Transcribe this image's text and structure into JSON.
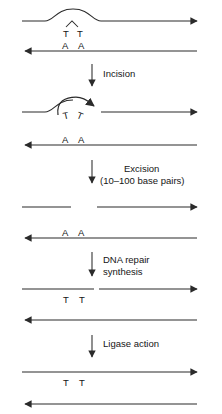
{
  "figure": {
    "type": "process-diagram",
    "stage_count": 5,
    "step_count": 4
  },
  "steps": [
    {
      "id": "incision",
      "label": "Incision",
      "label_lines": [
        "Incision"
      ]
    },
    {
      "id": "excision",
      "label": "Excision (10–100 base pairs)",
      "label_lines": [
        "Excision",
        "(10–100 base pairs)"
      ]
    },
    {
      "id": "dna-repair-synthesis",
      "label": "DNA repair synthesis",
      "label_lines": [
        "DNA repair",
        "synthesis"
      ]
    },
    {
      "id": "ligase-action",
      "label": "Ligase action",
      "label_lines": [
        "Ligase action"
      ]
    }
  ],
  "stages": [
    {
      "id": "stage-damaged",
      "top_strand": {
        "direction": "rightward",
        "continuous": true,
        "bulge": true
      },
      "top_bases": [
        "T",
        "T"
      ],
      "dimer_bond": "^",
      "bottom_strand": {
        "direction": "leftward",
        "continuous": true
      },
      "bottom_bases": [
        "A",
        "A"
      ]
    },
    {
      "id": "stage-incised",
      "top_strand": {
        "direction": "rightward",
        "continuous": false,
        "bulge": true,
        "flap": true
      },
      "top_bases": [
        "T",
        "T"
      ],
      "bottom_strand": {
        "direction": "leftward",
        "continuous": true
      },
      "bottom_bases": [
        "A",
        "A"
      ]
    },
    {
      "id": "stage-excised",
      "top_strand": {
        "direction": "rightward",
        "continuous": false,
        "gap": true
      },
      "top_bases": [],
      "bottom_strand": {
        "direction": "leftward",
        "continuous": true
      },
      "bottom_bases": [
        "A",
        "A"
      ]
    },
    {
      "id": "stage-resynthesized",
      "top_strand": {
        "direction": "rightward",
        "continuous": false,
        "nick": true
      },
      "top_bases": [
        "T",
        "T"
      ],
      "bottom_strand": {
        "direction": "leftward",
        "continuous": true
      },
      "bottom_bases": []
    },
    {
      "id": "stage-ligated",
      "top_strand": {
        "direction": "rightward",
        "continuous": true
      },
      "top_bases": [
        "T",
        "T"
      ],
      "bottom_strand": {
        "direction": "leftward",
        "continuous": true
      },
      "bottom_bases": []
    }
  ],
  "colors": {
    "background": "#ffffff",
    "stroke": "#2b2b2b",
    "text": "#151515"
  }
}
